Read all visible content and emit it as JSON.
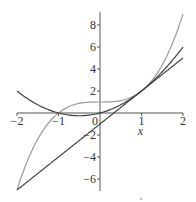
{
  "chart_data": {
    "type": "line",
    "title": "",
    "xlabel": "x",
    "ylabel": "",
    "xlim": [
      -2,
      2
    ],
    "ylim": [
      -7,
      9
    ],
    "grid": false,
    "legend": null,
    "x_ticks": [
      -2,
      -1,
      0,
      1,
      2
    ],
    "y_ticks": [
      -6,
      -4,
      -2,
      2,
      4,
      6,
      8
    ],
    "x_tick_labels": [
      "-2",
      "-1",
      "0",
      "1",
      "2"
    ],
    "y_tick_labels": [
      "-6",
      "-4",
      "-2",
      "2",
      "4",
      "6",
      "8"
    ],
    "series": [
      {
        "name": "y = x^3 + 1",
        "color": "#9a9a9a",
        "x": [
          -2,
          -1.5,
          -1,
          -0.5,
          0,
          0.5,
          1,
          1.5,
          2
        ],
        "values": [
          -7,
          -2.375,
          0,
          0.875,
          1,
          1.125,
          2,
          4.375,
          9
        ]
      },
      {
        "name": "y = x^2 + x",
        "color": "#404040",
        "x": [
          -2,
          -1.5,
          -1,
          -0.5,
          0,
          0.5,
          1,
          1.5,
          2
        ],
        "values": [
          2,
          0.75,
          0,
          -0.25,
          0,
          0.75,
          2,
          3.75,
          6
        ]
      },
      {
        "name": "y = 3x - 1",
        "color": "#404040",
        "x": [
          -2,
          2
        ],
        "values": [
          -7,
          5
        ]
      }
    ]
  }
}
